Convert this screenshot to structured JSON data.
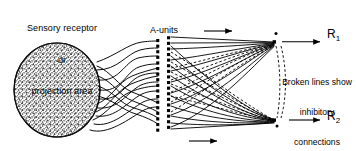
{
  "diagram": {
    "title_region": {
      "sensory_label_lines": [
        "Sensory receptor",
        "or",
        "projection area"
      ],
      "sensory_label_full": "Sensory receptor or projection area"
    },
    "labels": {
      "a_units": "A-units",
      "broken_lines_lines": [
        "Broken lines show",
        "inhibitory",
        "connections"
      ],
      "broken_lines_full": "Broken lines show inhibitory connections",
      "response_1_base": "R",
      "response_1_sub": "1",
      "response_2_base": "R",
      "response_2_sub": "2"
    },
    "colors": {
      "ink": "#000000",
      "background": "#ffffff",
      "stipple": "#4a4a4a"
    },
    "structure": {
      "retina_shape": "stippled-ellipse",
      "a_unit_columns": 2,
      "a_units_per_column": 17,
      "response_units": 2,
      "flow_arrows": 3,
      "solid_lines_meaning": "excitatory connections",
      "dashed_lines_meaning": "inhibitory connections"
    }
  }
}
